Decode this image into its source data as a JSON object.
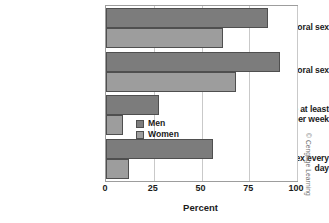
{
  "chart_data": {
    "type": "bar",
    "orientation": "horizontal",
    "title": "",
    "xlabel": "Percent",
    "ylabel": "",
    "xlim": [
      0,
      100
    ],
    "xticks": [
      0,
      25,
      50,
      75,
      100
    ],
    "xtick_labels": [
      "0",
      "25",
      "50",
      "75",
      "100"
    ],
    "grid": "vertical",
    "legend_position": "inside-right-middle",
    "categories": [
      "Like to perform oral sex",
      "Like to receive oral sex",
      "Masturbate at least once per week",
      "Think about sex every day"
    ],
    "category_label_lines": [
      [
        "Like to perform oral sex"
      ],
      [
        "Like to receive oral sex"
      ],
      [
        "Masturbate at least",
        "once per week"
      ],
      [
        "Think about sex every day"
      ]
    ],
    "series": [
      {
        "name": "Men",
        "color": "#7c7c7c",
        "values": [
          85,
          91,
          28,
          56
        ]
      },
      {
        "name": "Women",
        "color": "#9d9d9d",
        "values": [
          61,
          68,
          9,
          12
        ]
      }
    ]
  },
  "legend": {
    "items": [
      {
        "label": "Men",
        "color": "#7c7c7c"
      },
      {
        "label": "Women",
        "color": "#9d9d9d"
      }
    ]
  },
  "credit": "© Cengage Learning",
  "colors": {
    "men": "#7c7c7c",
    "women": "#9d9d9d",
    "bar_outline": "#4f4f4f",
    "frame": "#9d9d9d",
    "gridline": "#c9c9c9",
    "text": "#1b1b1b"
  }
}
